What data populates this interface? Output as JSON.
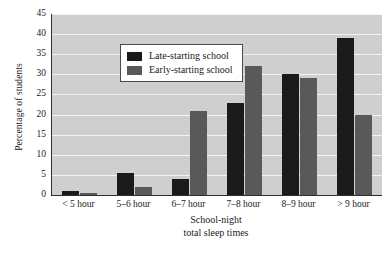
{
  "chart_data": {
    "type": "bar",
    "title": "",
    "xlabel": "School-night total sleep times",
    "xlabel_lines": [
      "School-night",
      "total sleep times"
    ],
    "ylabel": "Percentage of students",
    "categories": [
      "< 5 hour",
      "5–6 hour",
      "6–7 hour",
      "7–8 hour",
      "8–9 hour",
      "> 9 hour"
    ],
    "series": [
      {
        "name": "Late-starting school",
        "color": "#1a1a1a",
        "values": [
          1,
          5.5,
          4,
          23,
          30,
          39
        ]
      },
      {
        "name": "Early-starting school",
        "color": "#595959",
        "values": [
          0.5,
          2,
          21,
          32,
          29,
          20
        ]
      }
    ],
    "ylim": [
      0,
      45
    ],
    "yticks": [
      0,
      5,
      10,
      15,
      20,
      25,
      30,
      35,
      40,
      45
    ],
    "ytick_labels": [
      "0",
      "5",
      "10",
      "15",
      "20",
      "25",
      "30",
      "35",
      "40",
      "45"
    ],
    "grid": true,
    "grid_color": "#f2f2f2",
    "plot_background": "#cfcfcf",
    "legend_position": "upper-left-inside"
  }
}
